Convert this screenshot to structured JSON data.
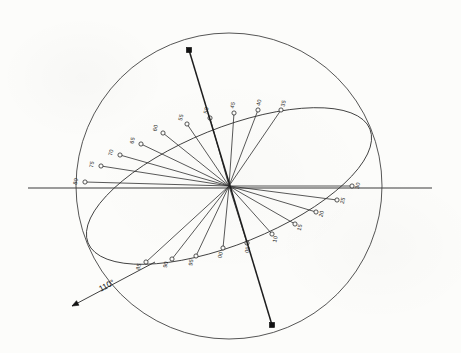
{
  "figure": {
    "background_color": "#fcfcfa",
    "ink_color": "#2b2b2b",
    "annotation": {
      "text": "110°",
      "name": "angle-annotation"
    }
  },
  "geometry": {
    "circle": {
      "cx": 229,
      "cy": 186,
      "r": 153
    },
    "ellipse": {
      "cx": 229,
      "cy": 186,
      "rx": 152,
      "ry": 58,
      "rotation_deg": -22
    },
    "center": {
      "x": 229,
      "y": 186
    },
    "horizontal_line": {
      "x1": 28,
      "y1": 188,
      "x2": 432,
      "y2": 188
    },
    "polar_axis": {
      "x1": 189,
      "y1": 50,
      "x2": 272,
      "y2": 325
    },
    "leader": {
      "x1": 155,
      "y1": 262,
      "x2": 72,
      "y2": 306
    }
  },
  "axis_markers": [
    {
      "name": "north-pole-marker",
      "x": 189,
      "y": 50
    },
    {
      "name": "south-pole-marker",
      "x": 272,
      "y": 325
    }
  ],
  "chart_data": {
    "type": "scatter",
    "xlabel": "",
    "ylabel": "",
    "legend": [],
    "grid": false,
    "note": "Numbered points lie on the great-circle ellipse; each is joined to the sphere centre by a spoke.",
    "categories": [
      "80",
      "75",
      "70",
      "65",
      "60",
      "55",
      "50",
      "45",
      "40",
      "35",
      "30",
      "25",
      "20",
      "15",
      "10",
      "05",
      "00",
      "95",
      "90",
      "85"
    ],
    "points": [
      {
        "label": "80",
        "x": 85,
        "y": 182,
        "angle_deg": 181
      },
      {
        "label": "75",
        "x": 101,
        "y": 166,
        "angle_deg": 188
      },
      {
        "label": "70",
        "x": 120,
        "y": 155,
        "angle_deg": 194
      },
      {
        "label": "65",
        "x": 141,
        "y": 144,
        "angle_deg": 200
      },
      {
        "label": "60",
        "x": 163,
        "y": 133,
        "angle_deg": 206
      },
      {
        "label": "55",
        "x": 187,
        "y": 124,
        "angle_deg": 213
      },
      {
        "label": "50",
        "x": 210,
        "y": 118,
        "angle_deg": 219
      },
      {
        "label": "45",
        "x": 234,
        "y": 113,
        "angle_deg": 226
      },
      {
        "label": "40",
        "x": 258,
        "y": 110,
        "angle_deg": 233
      },
      {
        "label": "35",
        "x": 281,
        "y": 110,
        "angle_deg": 240
      },
      {
        "label": "30",
        "x": 352,
        "y": 186,
        "angle_deg": 358
      },
      {
        "label": "25",
        "x": 337,
        "y": 200,
        "angle_deg": 8
      },
      {
        "label": "20",
        "x": 316,
        "y": 212,
        "angle_deg": 16
      },
      {
        "label": "15",
        "x": 295,
        "y": 224,
        "angle_deg": 24
      },
      {
        "label": "10",
        "x": 272,
        "y": 234,
        "angle_deg": 32
      },
      {
        "label": "05",
        "x": 247,
        "y": 243,
        "angle_deg": 40
      },
      {
        "label": "00",
        "x": 223,
        "y": 248,
        "angle_deg": 48
      },
      {
        "label": "95",
        "x": 196,
        "y": 256,
        "angle_deg": 56
      },
      {
        "label": "90",
        "x": 172,
        "y": 259,
        "angle_deg": 64
      },
      {
        "label": "85",
        "x": 146,
        "y": 262,
        "angle_deg": 72
      }
    ],
    "xlim": [
      0,
      461
    ],
    "ylim": [
      0,
      353
    ]
  }
}
